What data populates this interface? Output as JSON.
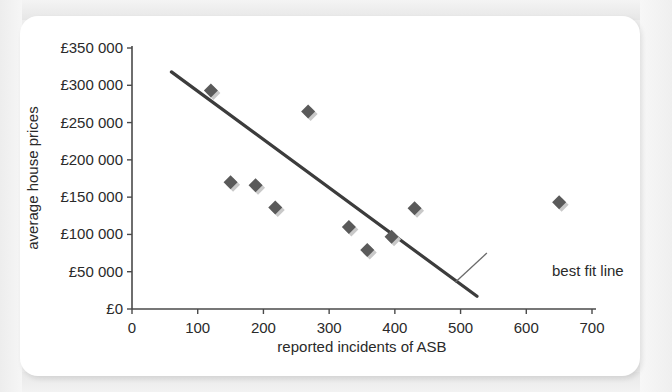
{
  "chart_data": {
    "type": "scatter",
    "title": "",
    "xlabel": "reported incidents of ASB",
    "ylabel": "average house prices",
    "xlim": [
      0,
      700
    ],
    "ylim": [
      0,
      350000
    ],
    "x_ticks": [
      0,
      100,
      200,
      300,
      400,
      500,
      600,
      700
    ],
    "x_tick_labels": [
      "0",
      "100",
      "200",
      "300",
      "400",
      "500",
      "600",
      "700"
    ],
    "y_ticks": [
      0,
      50000,
      100000,
      150000,
      200000,
      250000,
      300000,
      350000
    ],
    "y_tick_labels": [
      "£0",
      "£50 000",
      "£100 000",
      "£150 000",
      "£200 000",
      "£250 000",
      "£300 000",
      "£350 000"
    ],
    "grid": false,
    "legend": false,
    "marker": "diamond",
    "marker_color": "#5a5a5a",
    "points": [
      {
        "x": 120,
        "y": 293000
      },
      {
        "x": 150,
        "y": 170000
      },
      {
        "x": 188,
        "y": 166000
      },
      {
        "x": 218,
        "y": 136000
      },
      {
        "x": 268,
        "y": 265000
      },
      {
        "x": 330,
        "y": 110000
      },
      {
        "x": 358,
        "y": 79000
      },
      {
        "x": 395,
        "y": 97000
      },
      {
        "x": 430,
        "y": 135000
      },
      {
        "x": 650,
        "y": 143000
      }
    ],
    "trendline": {
      "label": "best fit line",
      "x_start": 60,
      "y_start": 318000,
      "x_end": 525,
      "y_end": 17000,
      "color": "#3c3c3c"
    },
    "annotation": {
      "text": "best fit line",
      "leader_from_x": 540,
      "leader_from_y": 75000,
      "leader_to_x": 492,
      "leader_to_y": 36000
    }
  },
  "colors": {
    "page_background": "#eeeeee",
    "card_background": "#ffffff",
    "axis": "#4a4a4a",
    "text": "#2a2a2a",
    "marker": "#5a5a5a",
    "trendline": "#3c3c3c"
  }
}
